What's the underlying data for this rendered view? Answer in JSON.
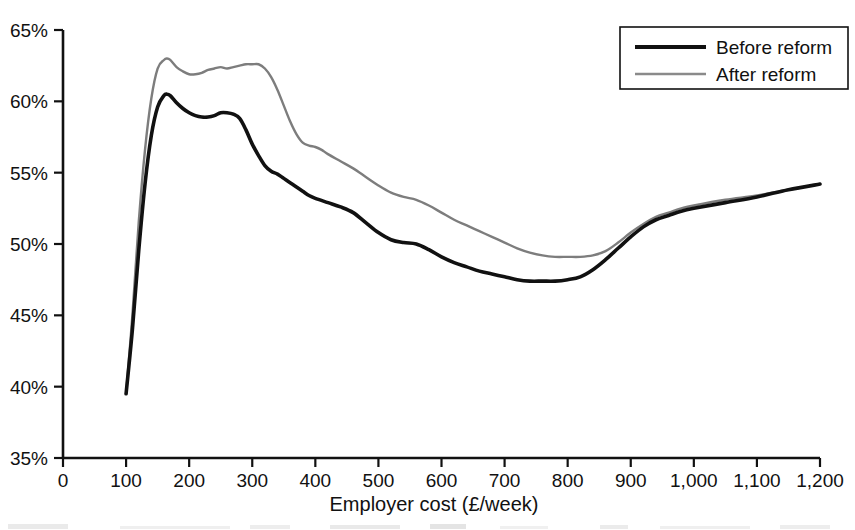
{
  "chart_data": {
    "type": "line",
    "title": "",
    "subtitle": "",
    "xlabel": "Employer cost (£/week)",
    "ylabel": "",
    "xlim": [
      0,
      1200
    ],
    "ylim": [
      35,
      65
    ],
    "xticks": [
      0,
      100,
      200,
      300,
      400,
      500,
      600,
      700,
      800,
      900,
      1000,
      1100,
      1200
    ],
    "xtick_labels": [
      "0",
      "100",
      "200",
      "300",
      "400",
      "500",
      "600",
      "700",
      "800",
      "900",
      "1,000",
      "1,100",
      "1,200"
    ],
    "yticks": [
      35,
      40,
      45,
      50,
      55,
      60,
      65
    ],
    "ytick_labels": [
      "35%",
      "40%",
      "45%",
      "50%",
      "55%",
      "60%",
      "65%"
    ],
    "grid": false,
    "legend_position": "top-right",
    "series": [
      {
        "name": "Before reform",
        "color": "#111111",
        "line_width": 3.6,
        "x": [
          100,
          110,
          120,
          130,
          140,
          150,
          160,
          165,
          170,
          180,
          190,
          200,
          210,
          220,
          230,
          240,
          250,
          260,
          270,
          280,
          290,
          300,
          310,
          320,
          330,
          340,
          350,
          360,
          370,
          380,
          390,
          400,
          420,
          440,
          460,
          480,
          500,
          520,
          540,
          560,
          580,
          600,
          620,
          640,
          660,
          680,
          700,
          720,
          740,
          760,
          780,
          800,
          820,
          840,
          860,
          880,
          900,
          920,
          940,
          960,
          980,
          1000,
          1050,
          1100,
          1150,
          1200
        ],
        "values": [
          39.5,
          44.0,
          49.5,
          54.2,
          57.6,
          59.6,
          60.4,
          60.5,
          60.4,
          59.9,
          59.5,
          59.2,
          59.0,
          58.9,
          58.9,
          59.0,
          59.2,
          59.2,
          59.1,
          58.8,
          58.0,
          57.0,
          56.2,
          55.5,
          55.1,
          54.9,
          54.6,
          54.3,
          54.0,
          53.7,
          53.4,
          53.2,
          52.9,
          52.6,
          52.2,
          51.5,
          50.8,
          50.3,
          50.1,
          50.0,
          49.6,
          49.1,
          48.7,
          48.4,
          48.1,
          47.9,
          47.7,
          47.5,
          47.4,
          47.4,
          47.4,
          47.5,
          47.7,
          48.2,
          48.9,
          49.7,
          50.5,
          51.2,
          51.7,
          52.0,
          52.3,
          52.5,
          52.9,
          53.3,
          53.8,
          54.2
        ]
      },
      {
        "name": "After reform",
        "color": "#7d7d7d",
        "line_width": 2.4,
        "x": [
          100,
          110,
          120,
          130,
          140,
          150,
          160,
          165,
          170,
          180,
          190,
          200,
          210,
          220,
          230,
          240,
          250,
          260,
          270,
          280,
          290,
          300,
          310,
          320,
          330,
          340,
          350,
          360,
          370,
          380,
          390,
          400,
          410,
          420,
          440,
          460,
          480,
          500,
          520,
          540,
          560,
          580,
          600,
          620,
          640,
          660,
          680,
          700,
          720,
          740,
          760,
          780,
          800,
          820,
          840,
          860,
          880,
          900,
          920,
          940,
          960,
          980,
          1000,
          1050,
          1100,
          1150,
          1200
        ],
        "values": [
          39.5,
          45.0,
          51.5,
          56.6,
          60.2,
          62.3,
          62.9,
          63.0,
          62.9,
          62.4,
          62.1,
          61.9,
          61.9,
          62.0,
          62.2,
          62.3,
          62.4,
          62.3,
          62.4,
          62.5,
          62.6,
          62.6,
          62.6,
          62.3,
          61.7,
          60.8,
          59.7,
          58.6,
          57.7,
          57.1,
          56.9,
          56.8,
          56.6,
          56.3,
          55.8,
          55.3,
          54.7,
          54.1,
          53.6,
          53.3,
          53.1,
          52.7,
          52.2,
          51.7,
          51.3,
          50.9,
          50.5,
          50.1,
          49.7,
          49.4,
          49.2,
          49.1,
          49.1,
          49.1,
          49.2,
          49.5,
          50.1,
          50.8,
          51.4,
          51.9,
          52.2,
          52.5,
          52.7,
          53.1,
          53.4,
          53.8,
          54.2
        ]
      }
    ]
  },
  "legend": {
    "items": [
      {
        "label": "Before reform",
        "style": "thick-black-line"
      },
      {
        "label": "After reform",
        "style": "thin-grey-line"
      }
    ]
  },
  "caption": {
    "text": ""
  }
}
